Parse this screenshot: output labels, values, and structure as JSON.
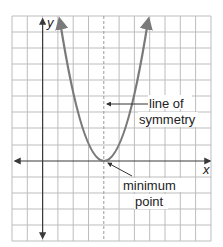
{
  "figure": {
    "type": "parabola-diagram",
    "axes": {
      "x_label": "x",
      "y_label": "y"
    },
    "annotations": {
      "symmetry_line_1": "line of",
      "symmetry_line_2": "symmetry",
      "minimum_line_1": "minimum",
      "minimum_line_2": "point"
    },
    "grid": {
      "columns": 13,
      "rows": 14
    },
    "colors": {
      "grid": "#bdbdbd",
      "axis": "#3a3a3a",
      "curve": "#7a7a7a",
      "text": "#222222",
      "pointer": "#333333"
    }
  }
}
